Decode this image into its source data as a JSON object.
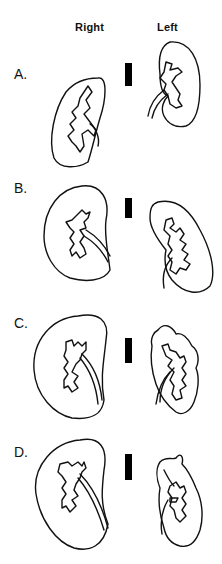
{
  "figure": {
    "column_labels": {
      "right": "Right",
      "left": "Left"
    },
    "rows": [
      {
        "label": "A.",
        "right_kidney": "normal-size kidney with branched collecting system",
        "left_kidney": "normal-size kidney with branched collecting system"
      },
      {
        "label": "B.",
        "right_kidney": "enlarged kidney",
        "left_kidney": "kidney with distorted calyces"
      },
      {
        "label": "C.",
        "right_kidney": "enlarged kidney",
        "left_kidney": "kidney with lobulated irregular contour"
      },
      {
        "label": "D.",
        "right_kidney": "enlarged kidney",
        "left_kidney": "small scarred lobulated kidney"
      }
    ],
    "scale_bar_color": "#000000",
    "line_color": "#111111"
  }
}
